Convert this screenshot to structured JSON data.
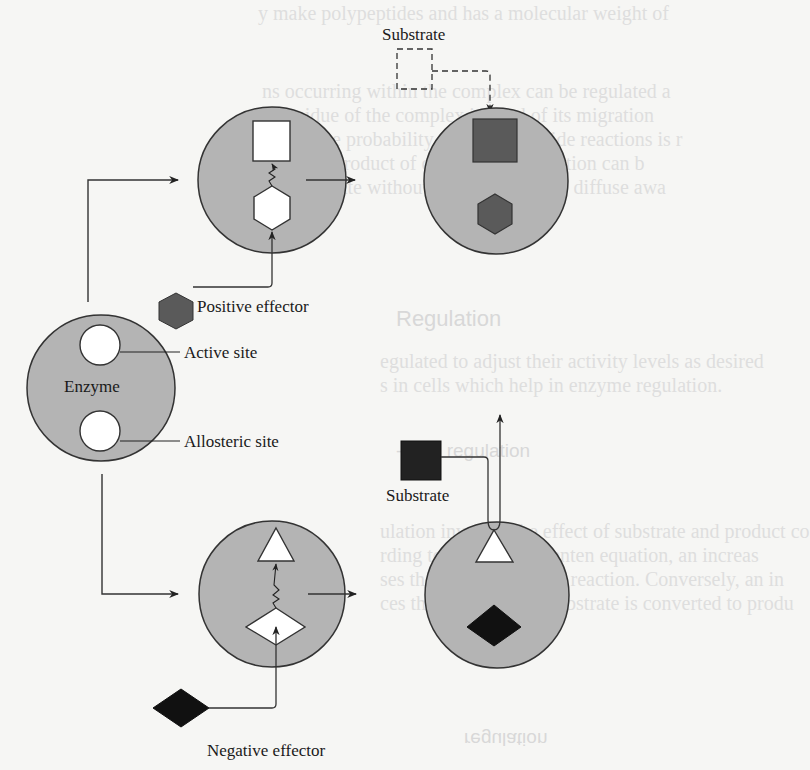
{
  "diagram": {
    "enzyme_label": "Enzyme",
    "active_site_label": "Active site",
    "allosteric_site_label": "Allosteric site",
    "positive_effector_label": "Positive effector",
    "negative_effector_label": "Negative effector",
    "substrate_label_top": "Substrate",
    "substrate_label_bottom": "Substrate",
    "colors": {
      "enzyme_fill": "#b4b4b4",
      "outline": "#333333",
      "positive_effector_fill": "#5a5a5a",
      "bound_substrate_fill": "#5a5a5a",
      "negative_effector_fill": "#111111",
      "site_fill": "#ffffff"
    }
  },
  "background_text": {
    "line1": "y make polypeptides and has a molecular weight of",
    "line2": "ns occurring within the complex can be regulated a",
    "line3": "al residue of the complex instead of its migration",
    "line4": "ons of the probability of unwanted side reactions is r",
    "line5": "gles, the product of one chemical reaction can b",
    "line6": "n a substrate without being released to diffuse awa",
    "heading1": "Regulation",
    "line7": "egulated to adjust their activity levels as desired",
    "line8": "s in cells which help in enzyme regulation.",
    "heading2": "-level regulation",
    "line9": "ulation involves the effect of substrate and product co",
    "line10": "rding to Michaelis-Menten equation, an increas",
    "line11": "ses the enzyme rates of reaction. Conversely, an in",
    "line12": "ces the rate at which substrate is converted to produ",
    "heading3": "regulation"
  }
}
